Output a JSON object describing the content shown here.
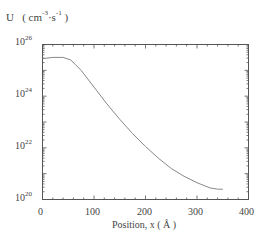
{
  "chart_data": {
    "type": "line",
    "title": "",
    "ylabel": "U  ( cm⁻³·s⁻¹ )",
    "ylabel_unit": "cm-3·s-1",
    "xlabel": "Position, x ( Å )",
    "yscale": "log",
    "xlim": [
      0,
      400
    ],
    "ylim": [
      1e+20,
      1e+26
    ],
    "x_ticks": [
      0,
      100,
      200,
      300,
      400
    ],
    "y_ticks": [
      "10^20",
      "10^22",
      "10^24",
      "10^26"
    ],
    "grid": false,
    "legend": null,
    "series": [
      {
        "name": "U",
        "x": [
          0,
          20,
          40,
          55,
          75,
          100,
          125,
          150,
          175,
          200,
          225,
          250,
          275,
          300,
          325,
          340,
          350
        ],
        "log10_y": [
          25.45,
          25.5,
          25.5,
          25.4,
          25.0,
          24.35,
          23.7,
          23.1,
          22.55,
          22.05,
          21.6,
          21.2,
          20.9,
          20.65,
          20.45,
          20.4,
          20.4
        ]
      }
    ]
  },
  "labels": {
    "y_axis_prefix": "U",
    "y_axis_unit_open": "( cm",
    "y_axis_unit_exp1": "-3",
    "y_axis_unit_mid": "·s",
    "y_axis_unit_exp2": "-1",
    "y_axis_unit_close": " )",
    "x_axis": "Position, x ( Å )",
    "ytick_base": "10",
    "ytick_exps": [
      "26",
      "24",
      "22",
      "20"
    ],
    "xticks": [
      "0",
      "100",
      "200",
      "300",
      "400"
    ]
  }
}
